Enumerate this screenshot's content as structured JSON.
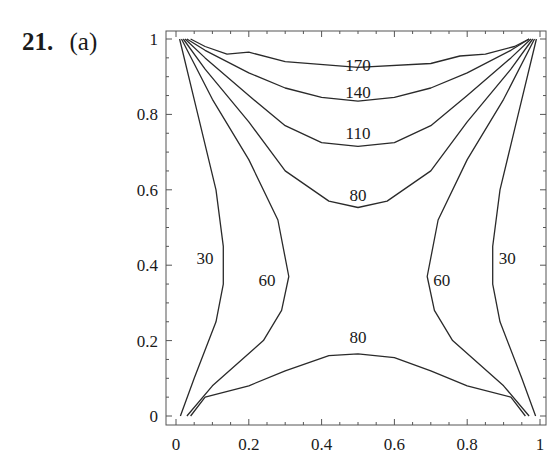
{
  "problem": {
    "number": "21.",
    "part": "(a)"
  },
  "chart_data": {
    "type": "contour",
    "title": "",
    "xlabel": "",
    "ylabel": "",
    "xlim": [
      0,
      1
    ],
    "ylim": [
      0,
      1
    ],
    "grid": false,
    "x_ticks": [
      "0",
      "0.2",
      "0.4",
      "0.6",
      "0.8",
      "1"
    ],
    "y_ticks": [
      "0",
      "0.2",
      "0.4",
      "0.6",
      "0.8",
      "1"
    ],
    "contour_levels": [
      30,
      60,
      80,
      110,
      140,
      170
    ],
    "contour_labels": [
      {
        "text": "170",
        "x": 0.5,
        "y": 0.93
      },
      {
        "text": "140",
        "x": 0.5,
        "y": 0.86
      },
      {
        "text": "110",
        "x": 0.5,
        "y": 0.75
      },
      {
        "text": "80",
        "x": 0.5,
        "y": 0.585
      },
      {
        "text": "30",
        "x": 0.08,
        "y": 0.42
      },
      {
        "text": "60",
        "x": 0.25,
        "y": 0.36
      },
      {
        "text": "60",
        "x": 0.73,
        "y": 0.36
      },
      {
        "text": "30",
        "x": 0.91,
        "y": 0.42
      },
      {
        "text": "80",
        "x": 0.5,
        "y": 0.21
      }
    ],
    "contours": [
      {
        "level": 170,
        "points": [
          [
            0.04,
            1.0
          ],
          [
            0.08,
            0.98
          ],
          [
            0.14,
            0.96
          ],
          [
            0.2,
            0.965
          ],
          [
            0.3,
            0.94
          ],
          [
            0.5,
            0.925
          ],
          [
            0.7,
            0.935
          ],
          [
            0.78,
            0.955
          ],
          [
            0.85,
            0.96
          ],
          [
            0.93,
            0.98
          ],
          [
            0.97,
            1.0
          ]
        ]
      },
      {
        "level": 140,
        "points": [
          [
            0.03,
            1.0
          ],
          [
            0.08,
            0.97
          ],
          [
            0.2,
            0.91
          ],
          [
            0.3,
            0.87
          ],
          [
            0.4,
            0.845
          ],
          [
            0.5,
            0.835
          ],
          [
            0.6,
            0.845
          ],
          [
            0.7,
            0.87
          ],
          [
            0.8,
            0.91
          ],
          [
            0.92,
            0.97
          ],
          [
            0.97,
            1.0
          ]
        ]
      },
      {
        "level": 110,
        "points": [
          [
            0.025,
            1.0
          ],
          [
            0.08,
            0.95
          ],
          [
            0.2,
            0.85
          ],
          [
            0.3,
            0.77
          ],
          [
            0.4,
            0.725
          ],
          [
            0.5,
            0.715
          ],
          [
            0.6,
            0.725
          ],
          [
            0.7,
            0.77
          ],
          [
            0.8,
            0.85
          ],
          [
            0.92,
            0.95
          ],
          [
            0.975,
            1.0
          ]
        ]
      },
      {
        "level": 80,
        "points": [
          [
            0.02,
            1.0
          ],
          [
            0.08,
            0.92
          ],
          [
            0.2,
            0.78
          ],
          [
            0.3,
            0.65
          ],
          [
            0.42,
            0.57
          ],
          [
            0.5,
            0.553
          ],
          [
            0.58,
            0.57
          ],
          [
            0.7,
            0.65
          ],
          [
            0.8,
            0.78
          ],
          [
            0.92,
            0.92
          ],
          [
            0.98,
            1.0
          ]
        ]
      },
      {
        "level": 60,
        "points": [
          [
            0.015,
            1.0
          ],
          [
            0.1,
            0.84
          ],
          [
            0.2,
            0.68
          ],
          [
            0.28,
            0.52
          ],
          [
            0.31,
            0.37
          ],
          [
            0.29,
            0.28
          ],
          [
            0.24,
            0.2
          ],
          [
            0.1,
            0.08
          ],
          [
            0.03,
            0.0
          ]
        ]
      },
      {
        "level": 60,
        "points": [
          [
            0.985,
            1.0
          ],
          [
            0.9,
            0.84
          ],
          [
            0.8,
            0.68
          ],
          [
            0.72,
            0.52
          ],
          [
            0.69,
            0.37
          ],
          [
            0.71,
            0.28
          ],
          [
            0.76,
            0.2
          ],
          [
            0.9,
            0.08
          ],
          [
            0.97,
            0.0
          ]
        ]
      },
      {
        "level": 30,
        "points": [
          [
            0.01,
            1.0
          ],
          [
            0.06,
            0.8
          ],
          [
            0.11,
            0.6
          ],
          [
            0.13,
            0.45
          ],
          [
            0.13,
            0.35
          ],
          [
            0.11,
            0.25
          ],
          [
            0.05,
            0.1
          ],
          [
            0.012,
            0.0
          ]
        ]
      },
      {
        "level": 30,
        "points": [
          [
            0.99,
            1.0
          ],
          [
            0.94,
            0.8
          ],
          [
            0.89,
            0.6
          ],
          [
            0.87,
            0.45
          ],
          [
            0.87,
            0.35
          ],
          [
            0.89,
            0.25
          ],
          [
            0.95,
            0.1
          ],
          [
            0.988,
            0.0
          ]
        ]
      },
      {
        "level": 80,
        "points": [
          [
            0.04,
            0.0
          ],
          [
            0.08,
            0.05
          ],
          [
            0.2,
            0.08
          ],
          [
            0.3,
            0.12
          ],
          [
            0.42,
            0.16
          ],
          [
            0.5,
            0.165
          ],
          [
            0.6,
            0.155
          ],
          [
            0.7,
            0.12
          ],
          [
            0.8,
            0.08
          ],
          [
            0.92,
            0.05
          ],
          [
            0.96,
            0.0
          ]
        ]
      }
    ]
  }
}
